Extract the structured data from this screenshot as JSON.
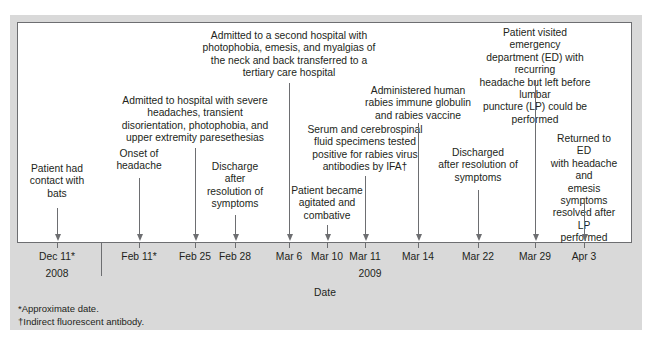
{
  "chart_data": {
    "type": "timeline",
    "xlabel": "Date",
    "years": [
      {
        "label": "2008",
        "x": 57
      },
      {
        "label": "2009",
        "x": 370
      }
    ],
    "events": [
      {
        "date": "Dec 11*",
        "x": 57,
        "text": "Patient had\ncontact with\nbats",
        "label_top": 163,
        "line_top": 208
      },
      {
        "date": "Feb 11*",
        "x": 139,
        "text": "Onset of\nheadache",
        "label_top": 148,
        "line_top": 178
      },
      {
        "date": "Feb 25",
        "x": 195,
        "text": "Admitted to hospital with severe\nheadaches, transient\ndisorientation, photophobia, and\nupper extremity paresethesias",
        "label_top": 95,
        "line_top": 148
      },
      {
        "date": "Feb 28",
        "x": 235,
        "text": "Discharge\nafter\nresolution of\nsymptoms",
        "label_top": 161,
        "line_top": 215
      },
      {
        "date": "Mar 6",
        "x": 289,
        "text": "Admitted to a second hospital with\nphotophobia, emesis, and myalgias of\nthe neck and back transferred to a\ntertiary care hospital",
        "label_top": 30,
        "line_top": 83
      },
      {
        "date": "Mar 10",
        "x": 327,
        "text": "Patient became\nagitated and\ncombative",
        "label_top": 185,
        "line_top": 225
      },
      {
        "date": "Mar 11",
        "x": 365,
        "text": "Serum and cerebrospinal\nfluid specimens tested\npositive for rabies virus\nantibodies by IFA†",
        "label_top": 124,
        "line_top": 176
      },
      {
        "date": "Mar 14",
        "x": 418,
        "text": "Administered human\nrabies immune globulin\nand rabies vaccine",
        "label_top": 85,
        "line_top": 123
      },
      {
        "date": "Mar 22",
        "x": 478,
        "text": "Discharged\nafter resolution of\nsymptoms",
        "label_top": 147,
        "line_top": 190
      },
      {
        "date": "Mar 29",
        "x": 535,
        "text": "Patient visited emergency\ndepartment (ED) with recurring\nheadache but left before lumbar\npuncture (LP) could be performed",
        "label_top": 27,
        "line_top": 80
      },
      {
        "date": "Apr 3",
        "x": 584,
        "text": "Returned to ED\nwith headache and\nemesis symptoms\nresolved after LP\nperformed",
        "label_top": 133,
        "line_top": 198
      }
    ],
    "footnotes": [
      "*Approximate date.",
      "†Indirect fluorescent antibody."
    ]
  }
}
